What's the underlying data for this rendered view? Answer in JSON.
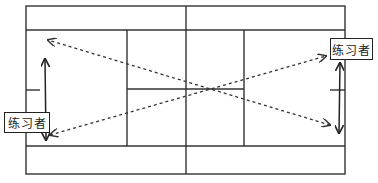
{
  "diagram": {
    "type": "tennis-court-drill",
    "colors": {
      "line": "#333333",
      "background": "#ffffff"
    },
    "labels": [
      {
        "id": "left",
        "text": "练习者"
      },
      {
        "id": "right",
        "text": "练习者"
      }
    ],
    "court": {
      "outer": {
        "x1": 26,
        "y1": 6,
        "x2": 345,
        "y2": 174
      },
      "singles_sidelines_y": [
        30,
        146
      ],
      "service_lines_x": [
        127,
        244
      ],
      "net_x": 186,
      "center_service_line_y": 89
    },
    "paths": [
      {
        "name": "diagonal-shot-1",
        "style": "dashed",
        "from": [
          330,
          125
        ],
        "to": [
          48,
          40
        ]
      },
      {
        "name": "diagonal-shot-2",
        "style": "dashed",
        "from": [
          50,
          135
        ],
        "to": [
          326,
          56
        ]
      },
      {
        "name": "left-player-movement",
        "style": "solid-double-arrow",
        "from": [
          45,
          58
        ],
        "to": [
          45,
          141
        ]
      },
      {
        "name": "right-player-movement",
        "style": "solid-double-arrow",
        "from": [
          340,
          62
        ],
        "to": [
          340,
          134
        ]
      }
    ]
  }
}
